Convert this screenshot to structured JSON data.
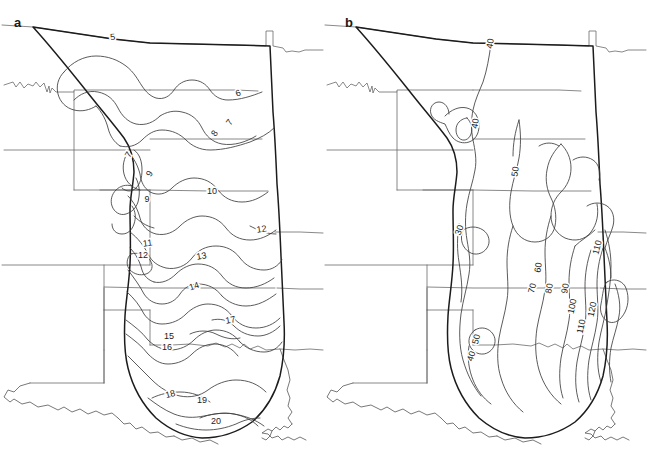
{
  "figure": {
    "type": "contour-map-figure",
    "panel_count": 2,
    "background_color": "#ffffff",
    "line_color": "#3d3d3d",
    "boundary_color": "#1c1c1c",
    "state_line_color": "#6b6b6b"
  },
  "panels": [
    {
      "id": "a",
      "letter": "a",
      "contour_labels": [
        {
          "text": "5",
          "x": 113,
          "y": 40,
          "rotate": -6
        },
        {
          "text": "6",
          "x": 239,
          "y": 96,
          "rotate": -20
        },
        {
          "text": "7",
          "x": 232,
          "y": 124,
          "rotate": -55
        },
        {
          "text": "8",
          "x": 217,
          "y": 135,
          "rotate": -55
        },
        {
          "text": "7",
          "x": 131,
          "y": 156,
          "rotate": -60
        },
        {
          "text": "9",
          "x": 152,
          "y": 175,
          "rotate": -60
        },
        {
          "text": "9",
          "x": 147,
          "y": 202,
          "rotate": 0
        },
        {
          "text": "10",
          "x": 212,
          "y": 194,
          "rotate": 0
        },
        {
          "text": "12",
          "x": 262,
          "y": 232,
          "rotate": -8
        },
        {
          "text": "11",
          "x": 148,
          "y": 246,
          "rotate": -8
        },
        {
          "text": "12",
          "x": 143,
          "y": 258,
          "rotate": 0
        },
        {
          "text": "13",
          "x": 202,
          "y": 259,
          "rotate": -10
        },
        {
          "text": "14",
          "x": 195,
          "y": 289,
          "rotate": -18
        },
        {
          "text": "17",
          "x": 231,
          "y": 323,
          "rotate": -10
        },
        {
          "text": "15",
          "x": 169,
          "y": 339,
          "rotate": 0
        },
        {
          "text": "16",
          "x": 167,
          "y": 350,
          "rotate": 0
        },
        {
          "text": "18",
          "x": 171,
          "y": 397,
          "rotate": -15
        },
        {
          "text": "19",
          "x": 202,
          "y": 403,
          "rotate": 0
        },
        {
          "text": "20",
          "x": 216,
          "y": 424,
          "rotate": 0
        }
      ],
      "contour_values": [
        5,
        6,
        7,
        8,
        9,
        10,
        11,
        12,
        13,
        14,
        15,
        16,
        17,
        18,
        19,
        20
      ]
    },
    {
      "id": "b",
      "letter": "b",
      "contour_labels": [
        {
          "text": "40",
          "x": 493,
          "y": 44,
          "rotate": -80
        },
        {
          "text": "40",
          "x": 478,
          "y": 124,
          "rotate": -80
        },
        {
          "text": "50",
          "x": 518,
          "y": 172,
          "rotate": -80
        },
        {
          "text": "30",
          "x": 462,
          "y": 231,
          "rotate": -70
        },
        {
          "text": "60",
          "x": 541,
          "y": 268,
          "rotate": -80
        },
        {
          "text": "110",
          "x": 600,
          "y": 248,
          "rotate": -75
        },
        {
          "text": "70",
          "x": 535,
          "y": 289,
          "rotate": -75
        },
        {
          "text": "80",
          "x": 552,
          "y": 289,
          "rotate": -78
        },
        {
          "text": "90",
          "x": 568,
          "y": 289,
          "rotate": -78
        },
        {
          "text": "100",
          "x": 575,
          "y": 307,
          "rotate": -78
        },
        {
          "text": "120",
          "x": 595,
          "y": 310,
          "rotate": -78
        },
        {
          "text": "110",
          "x": 584,
          "y": 327,
          "rotate": -78
        },
        {
          "text": "50",
          "x": 479,
          "y": 340,
          "rotate": -75
        },
        {
          "text": "40",
          "x": 474,
          "y": 357,
          "rotate": -72
        }
      ],
      "contour_values": [
        30,
        40,
        50,
        60,
        70,
        80,
        90,
        100,
        110,
        120
      ]
    }
  ]
}
